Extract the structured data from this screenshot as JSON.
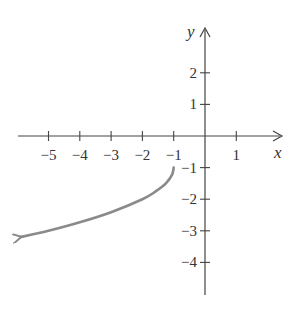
{
  "chart_data": {
    "type": "line",
    "title": "",
    "xlabel": "x",
    "ylabel": "y",
    "xlim": [
      -6,
      2.5
    ],
    "ylim": [
      -5,
      3.4
    ],
    "x_ticks": [
      -5,
      -4,
      -3,
      -2,
      -1,
      1
    ],
    "y_ticks": [
      2,
      1,
      -1,
      -2,
      -3,
      -4
    ],
    "x_tick_labels": [
      "−5",
      "−4",
      "−3",
      "−2",
      "−1",
      "1"
    ],
    "y_tick_labels": [
      "2",
      "1",
      "−1",
      "−2",
      "−3",
      "−4"
    ],
    "grid": false,
    "series": [
      {
        "name": "curve",
        "color": "#8a8a8a",
        "start_point": [
          -1,
          -1
        ],
        "end_arrow": true,
        "x": [
          -1,
          -1.05,
          -1.25,
          -1.6,
          -2,
          -3,
          -4,
          -5,
          -5.9
        ],
        "y": [
          -1,
          -1.22,
          -1.5,
          -1.77,
          -2,
          -2.41,
          -2.73,
          -3.0,
          -3.2
        ]
      }
    ]
  },
  "axes": {
    "x_label": "x",
    "y_label": "y"
  }
}
